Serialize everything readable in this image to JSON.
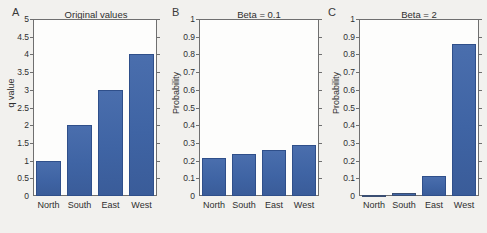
{
  "figure": {
    "panels": [
      {
        "letter": "A",
        "title": "Original values",
        "ylabel": "q value",
        "categories": [
          "North",
          "South",
          "East",
          "West"
        ],
        "values": [
          1,
          2,
          3,
          4
        ],
        "yticks": [
          "0",
          "0.5",
          "1",
          "1.5",
          "2",
          "2.5",
          "3",
          "3.5",
          "4",
          "4.5",
          "5"
        ],
        "ymin": 0,
        "ymax": 5
      },
      {
        "letter": "B",
        "title": "Beta = 0.1",
        "ylabel": "Probability",
        "categories": [
          "North",
          "South",
          "East",
          "West"
        ],
        "values": [
          0.214,
          0.237,
          0.262,
          0.288
        ],
        "yticks": [
          "0",
          "0.1",
          "0.2",
          "0.3",
          "0.4",
          "0.5",
          "0.6",
          "0.7",
          "0.8",
          "0.9",
          "1"
        ],
        "ymin": 0,
        "ymax": 1
      },
      {
        "letter": "C",
        "title": "Beta = 2",
        "ylabel": "Probability",
        "categories": [
          "North",
          "South",
          "East",
          "West"
        ],
        "values": [
          0.003,
          0.016,
          0.112,
          0.859
        ],
        "yticks": [
          "0",
          "0.1",
          "0.2",
          "0.3",
          "0.4",
          "0.5",
          "0.6",
          "0.7",
          "0.8",
          "0.9",
          "1"
        ],
        "ymin": 0,
        "ymax": 1
      }
    ],
    "colors": {
      "bar": "#41619f",
      "bar_edge": "#2f4f8a",
      "axis": "#6f6f6f",
      "background": "#f2f1ee",
      "plot_background": "#fdfdfc",
      "text": "#2f2f2f"
    }
  },
  "chart_data": [
    {
      "type": "bar",
      "panel": "A",
      "title": "Original values",
      "categories": [
        "North",
        "South",
        "East",
        "West"
      ],
      "values": [
        1,
        2,
        3,
        4
      ],
      "xlabel": "",
      "ylabel": "q value",
      "ylim": [
        0,
        5
      ],
      "ytick_step": 0.5,
      "grid": false,
      "legend": "none"
    },
    {
      "type": "bar",
      "panel": "B",
      "title": "Beta = 0.1",
      "categories": [
        "North",
        "South",
        "East",
        "West"
      ],
      "values": [
        0.214,
        0.237,
        0.262,
        0.288
      ],
      "xlabel": "",
      "ylabel": "Probability",
      "ylim": [
        0,
        1
      ],
      "ytick_step": 0.1,
      "grid": false,
      "legend": "none"
    },
    {
      "type": "bar",
      "panel": "C",
      "title": "Beta = 2",
      "categories": [
        "North",
        "South",
        "East",
        "West"
      ],
      "values": [
        0.003,
        0.016,
        0.112,
        0.859
      ],
      "xlabel": "",
      "ylabel": "Probability",
      "ylim": [
        0,
        1
      ],
      "ytick_step": 0.1,
      "grid": false,
      "legend": "none"
    }
  ]
}
